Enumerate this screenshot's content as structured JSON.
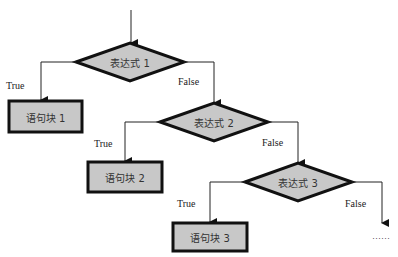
{
  "diagram": {
    "type": "flowchart",
    "colors": {
      "fill": "#c8c8c8",
      "stroke": "#111111",
      "line": "#222222"
    },
    "decisions": [
      {
        "id": "d1",
        "label": "表达式 1"
      },
      {
        "id": "d2",
        "label": "表达式 2"
      },
      {
        "id": "d3",
        "label": "表达式 3"
      }
    ],
    "blocks": [
      {
        "id": "b1",
        "label": "语句块 1"
      },
      {
        "id": "b2",
        "label": "语句块 2"
      },
      {
        "id": "b3",
        "label": "语句块 3"
      }
    ],
    "edges": [
      {
        "from": "start",
        "to": "d1",
        "label": ""
      },
      {
        "from": "d1",
        "to": "b1",
        "label": "True"
      },
      {
        "from": "d1",
        "to": "d2",
        "label": "False"
      },
      {
        "from": "d2",
        "to": "b2",
        "label": "True"
      },
      {
        "from": "d2",
        "to": "d3",
        "label": "False"
      },
      {
        "from": "d3",
        "to": "b3",
        "label": "True"
      },
      {
        "from": "d3",
        "to": "continue",
        "label": "False"
      }
    ],
    "continuation": "……"
  }
}
